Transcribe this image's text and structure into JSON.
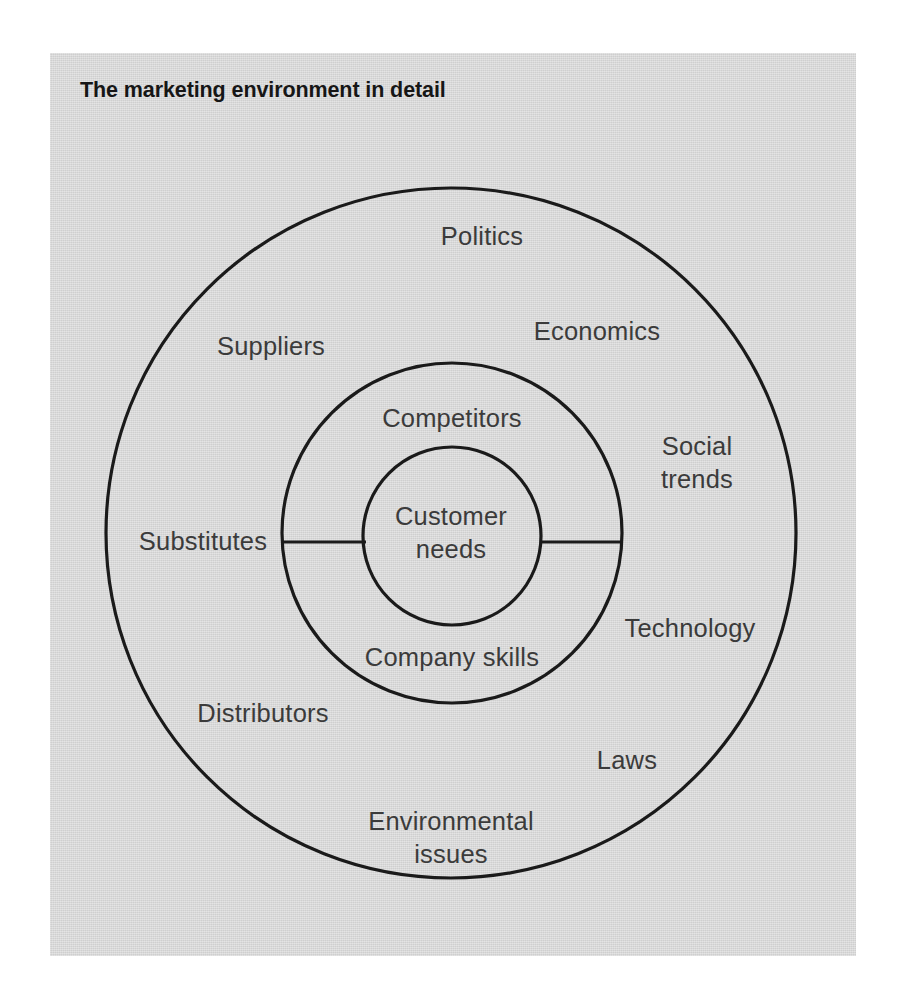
{
  "figure": {
    "title": "The marketing environment in detail",
    "page_background": "#ffffff",
    "panel_background": "#d4d4d4",
    "line_color": "#1a1a1a",
    "label_color": "#3b3b3b",
    "title_color": "#161616"
  },
  "diagram": {
    "type": "concentric-circles",
    "center": {
      "x": 451,
      "y": 533
    },
    "rings": [
      {
        "name": "macro-environment",
        "radius": 345,
        "label_ring": "outer"
      },
      {
        "name": "micro-environment",
        "radius": 170,
        "label_ring": "middle"
      },
      {
        "name": "core",
        "radius": 89,
        "label_ring": "inner"
      }
    ],
    "divider_lines": [
      {
        "name": "left-divider",
        "x1": 281,
        "y1": 542,
        "x2": 365,
        "y2": 542
      },
      {
        "name": "right-divider",
        "x1": 541,
        "y1": 542,
        "x2": 622,
        "y2": 542
      }
    ],
    "inner_labels": [
      {
        "id": "customer-needs",
        "lines": [
          "Customer",
          "needs"
        ],
        "x": 451,
        "y": 533
      }
    ],
    "middle_labels": [
      {
        "id": "competitors",
        "lines": [
          "Competitors"
        ],
        "x": 452,
        "y": 418
      },
      {
        "id": "company-skills",
        "lines": [
          "Company skills"
        ],
        "x": 452,
        "y": 657
      }
    ],
    "outer_labels": [
      {
        "id": "politics",
        "lines": [
          "Politics"
        ],
        "x": 482,
        "y": 236
      },
      {
        "id": "suppliers",
        "lines": [
          "Suppliers"
        ],
        "x": 271,
        "y": 346
      },
      {
        "id": "economics",
        "lines": [
          "Economics"
        ],
        "x": 597,
        "y": 331
      },
      {
        "id": "social-trends",
        "lines": [
          "Social",
          "trends"
        ],
        "x": 697,
        "y": 463
      },
      {
        "id": "substitutes",
        "lines": [
          "Substitutes"
        ],
        "x": 203,
        "y": 541
      },
      {
        "id": "technology",
        "lines": [
          "Technology"
        ],
        "x": 690,
        "y": 628
      },
      {
        "id": "distributors",
        "lines": [
          "Distributors"
        ],
        "x": 263,
        "y": 713
      },
      {
        "id": "laws",
        "lines": [
          "Laws"
        ],
        "x": 627,
        "y": 760
      },
      {
        "id": "environmental-issues",
        "lines": [
          "Environmental",
          "issues"
        ],
        "x": 451,
        "y": 838
      }
    ]
  }
}
